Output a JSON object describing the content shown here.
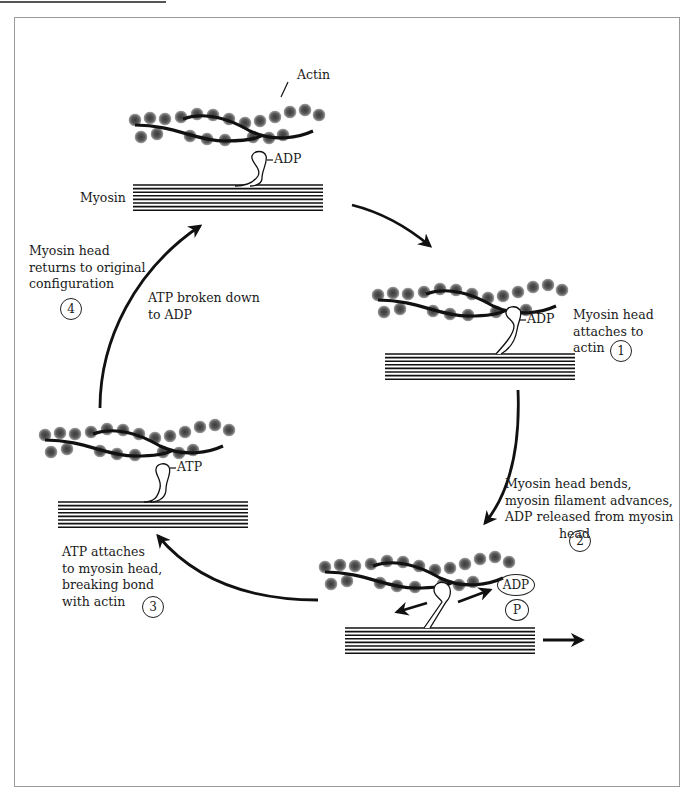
{
  "diagram": {
    "labels": {
      "actin": "Actin",
      "myosin": "Myosin",
      "adp_top": "ADP",
      "adp_right": "ADP",
      "atp_left": "ATP",
      "adp_released": "ADP",
      "phosphate": "P"
    },
    "steps": [
      {
        "number": "1",
        "lines": [
          "Myosin head",
          "attaches to",
          "actin"
        ]
      },
      {
        "number": "2",
        "lines": [
          "Myosin head bends,",
          "myosin filament advances,",
          "ADP released from myosin",
          "head"
        ]
      },
      {
        "number": "3",
        "lines": [
          "ATP attaches",
          "to myosin head,",
          "breaking bond",
          "with actin"
        ]
      },
      {
        "number": "4",
        "lines": [
          "Myosin head",
          "returns to original",
          "configuration"
        ]
      }
    ],
    "intermediate_note": {
      "lines": [
        "ATP broken down",
        "to ADP"
      ]
    },
    "colors": {
      "line": "#111111",
      "bead": "#555555",
      "frame": "#9a9a9a"
    }
  }
}
